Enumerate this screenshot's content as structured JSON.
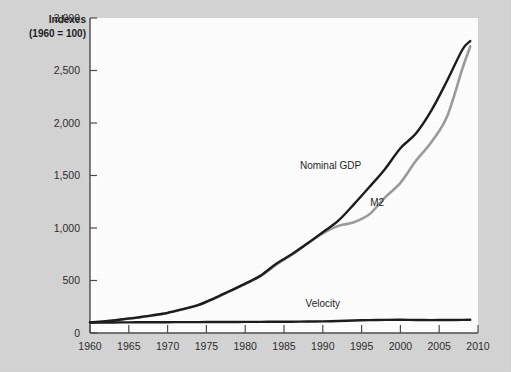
{
  "figure": {
    "background_color": "#d4d4d4",
    "plot_background_color": "#ffffff",
    "axis_color": "#4a4a4a"
  },
  "axis_title": {
    "line1": "Indexes",
    "line2": "(1960 = 100)"
  },
  "chart_data": {
    "type": "line",
    "title": "",
    "subtitle": "",
    "xlabel": "",
    "ylabel": "Indexes (1960 = 100)",
    "xlim": [
      1960,
      2010
    ],
    "ylim": [
      0,
      3000
    ],
    "grid": false,
    "legend_position": "inline-annotations",
    "xticks": [
      1960,
      1965,
      1970,
      1975,
      1980,
      1985,
      1990,
      1995,
      2000,
      2005,
      2010
    ],
    "xtick_labels": [
      "1960",
      "1965",
      "1970",
      "1975",
      "1980",
      "1985",
      "1990",
      "1995",
      "2000",
      "2005",
      "2010"
    ],
    "yticks": [
      0,
      500,
      1000,
      1500,
      2000,
      2500,
      3000
    ],
    "ytick_labels": [
      "0",
      "500",
      "1,000",
      "1,500",
      "2,000",
      "2,500",
      "3,000"
    ],
    "x": [
      1960,
      1962,
      1964,
      1966,
      1968,
      1970,
      1972,
      1974,
      1976,
      1978,
      1980,
      1982,
      1984,
      1986,
      1988,
      1990,
      1992,
      1994,
      1996,
      1998,
      2000,
      2002,
      2004,
      2006,
      2008,
      2009
    ],
    "series": [
      {
        "name": "Nominal GDP",
        "color": "#1a1a1a",
        "label_x": 1991,
        "label_y": 1560,
        "values": [
          100,
          112,
          128,
          146,
          168,
          192,
          228,
          268,
          330,
          400,
          470,
          548,
          660,
          750,
          852,
          960,
          1070,
          1225,
          1390,
          1560,
          1760,
          1900,
          2120,
          2400,
          2700,
          2780
        ]
      },
      {
        "name": "M2",
        "color": "#9b9b9b",
        "label_x": 1997,
        "label_y": 1205,
        "values": [
          100,
          112,
          128,
          146,
          166,
          190,
          226,
          268,
          328,
          398,
          466,
          542,
          650,
          745,
          850,
          950,
          1020,
          1055,
          1130,
          1290,
          1430,
          1640,
          1820,
          2060,
          2520,
          2730
        ]
      },
      {
        "name": "Velocity",
        "color": "#1a1a1a",
        "label_x": 1990,
        "label_y": 250,
        "values": [
          100,
          100,
          101,
          102,
          103,
          103,
          104,
          104,
          105,
          105,
          106,
          106,
          107,
          107,
          109,
          111,
          114,
          119,
          123,
          125,
          126,
          124,
          123,
          124,
          125,
          126
        ]
      }
    ]
  }
}
